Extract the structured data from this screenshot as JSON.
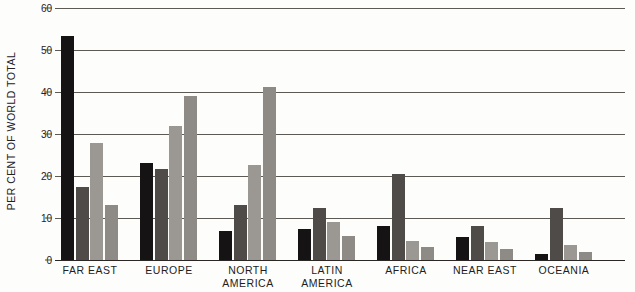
{
  "chart_data": {
    "type": "bar",
    "title": "",
    "xlabel": "",
    "ylabel": "PER CENT OF WORLD TOTAL",
    "ylim": [
      0,
      60
    ],
    "yticks": [
      0,
      10,
      20,
      30,
      40,
      50,
      60
    ],
    "ytick_labels": [
      "0",
      "10",
      "20",
      "30",
      "40",
      "50",
      "60"
    ],
    "grid": true,
    "legend": "none",
    "categories": [
      "FAR EAST",
      "EUROPE",
      "NORTH AMERICA",
      "LATIN AMERICA",
      "AFRICA",
      "NEAR EAST",
      "OCEANIA"
    ],
    "category_lines": [
      [
        "FAR EAST"
      ],
      [
        "EUROPE"
      ],
      [
        "NORTH",
        "AMERICA"
      ],
      [
        "LATIN",
        "AMERICA"
      ],
      [
        "AFRICA"
      ],
      [
        "NEAR EAST"
      ],
      [
        "OCEANIA"
      ]
    ],
    "series": [
      {
        "name": "series-1",
        "color": "#151313",
        "values": [
          53.3,
          23.0,
          7.0,
          7.5,
          8.0,
          5.5,
          1.5
        ]
      },
      {
        "name": "series-2",
        "color": "#4e4b49",
        "values": [
          17.3,
          21.7,
          13.2,
          12.4,
          20.5,
          8.0,
          12.5
        ]
      },
      {
        "name": "series-3",
        "color": "#9b9894",
        "values": [
          27.8,
          32.0,
          22.6,
          9.0,
          4.5,
          4.2,
          3.6
        ]
      },
      {
        "name": "series-4",
        "color": "#8e8b87",
        "values": [
          13.1,
          39.0,
          41.2,
          5.6,
          3.0,
          2.6,
          2.0
        ]
      }
    ]
  }
}
